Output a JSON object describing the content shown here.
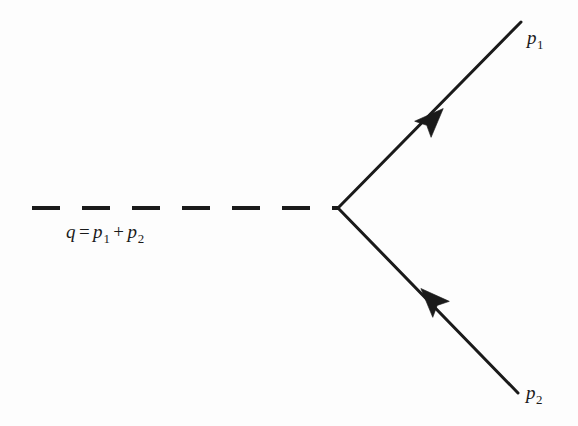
{
  "figure": {
    "kind": "feynman-diagram",
    "background_color": "#fdfdfd",
    "line_color": "#1a1a1a"
  },
  "labels": {
    "momentum_conservation": {
      "name": "momentum-sum-equation",
      "q": "q",
      "equals": "=",
      "p_symbol": "p",
      "sub_1": "1",
      "plus": "+",
      "sub_2": "2"
    },
    "outgoing_upper": {
      "name": "p1-label",
      "symbol": "p",
      "subscript": "1"
    },
    "outgoing_lower": {
      "name": "p2-label",
      "symbol": "p",
      "subscript": "2"
    }
  },
  "geometry": {
    "vertex": {
      "x": 338,
      "y": 208
    },
    "propagator": {
      "name": "dashed-propagator-line",
      "x_start": 32,
      "x_end": 338,
      "y": 208,
      "dash_length": 28,
      "gap_length": 22,
      "stroke_width": 4,
      "dash_count": 6
    },
    "upper_ray": {
      "name": "upper-fermion-line",
      "x_end": 521,
      "y_end": 22,
      "stroke_width": 3,
      "arrow_x": 432,
      "arrow_y": 120
    },
    "lower_ray": {
      "name": "lower-fermion-line",
      "x_end": 518,
      "y_end": 393,
      "stroke_width": 3,
      "arrow_x": 432,
      "arrow_y": 300
    }
  }
}
